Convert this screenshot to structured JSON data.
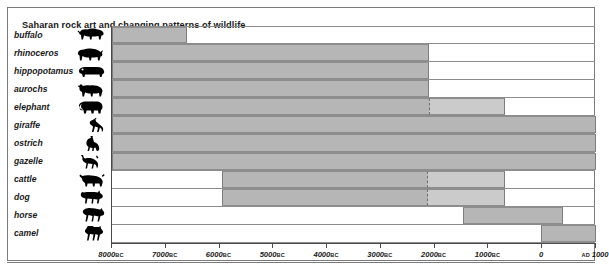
{
  "chart": {
    "title": "Saharan rock art and changing patterns of wildlife"
  },
  "chart_data": {
    "type": "bar",
    "title": "Saharan rock art and changing patterns of wildlife",
    "xlabel": "",
    "ylabel": "",
    "orientation": "horizontal",
    "note": "Horizontal range bars: each animal's period of depiction in Saharan rock art. Negative years = BC, positive = AD. Lighter segment after dashed line indicates uncertain / declining presence.",
    "xlim": [
      -8000,
      1000
    ],
    "grid": false,
    "legend": null,
    "xticks": [
      -8000,
      -7000,
      -6000,
      -5000,
      -4000,
      -3000,
      -2000,
      -1000,
      0,
      1000
    ],
    "xticklabels": [
      "8000 BC",
      "7000 BC",
      "6000 BC",
      "5000 BC",
      "4000 BC",
      "3000 BC",
      "2000 BC",
      "1000 BC",
      "0",
      "AD 1000"
    ],
    "categories": [
      "buffalo",
      "rhinoceros",
      "hippopotamus",
      "aurochs",
      "elephant",
      "giraffe",
      "ostrich",
      "gazelle",
      "cattle",
      "dog",
      "horse",
      "camel"
    ],
    "bars": [
      {
        "label": "buffalo",
        "icon": "buffalo-icon",
        "start": -8000,
        "end": -6600,
        "fade_from": null
      },
      {
        "label": "rhinoceros",
        "icon": "rhinoceros-icon",
        "start": -8000,
        "end": -2100,
        "fade_from": null
      },
      {
        "label": "hippopotamus",
        "icon": "hippopotamus-icon",
        "start": -8000,
        "end": -2100,
        "fade_from": null
      },
      {
        "label": "aurochs",
        "icon": "aurochs-icon",
        "start": -8000,
        "end": -2100,
        "fade_from": null
      },
      {
        "label": "elephant",
        "icon": "elephant-icon",
        "start": -8000,
        "end": -700,
        "fade_from": -2100
      },
      {
        "label": "giraffe",
        "icon": "giraffe-icon",
        "start": -8000,
        "end": 1000,
        "fade_from": null
      },
      {
        "label": "ostrich",
        "icon": "ostrich-icon",
        "start": -8000,
        "end": 1000,
        "fade_from": null
      },
      {
        "label": "gazelle",
        "icon": "gazelle-icon",
        "start": -8000,
        "end": 1000,
        "fade_from": null
      },
      {
        "label": "cattle",
        "icon": "cattle-icon",
        "start": -5950,
        "end": -700,
        "fade_from": -2150
      },
      {
        "label": "dog",
        "icon": "dog-icon",
        "start": -5950,
        "end": -700,
        "fade_from": -2150
      },
      {
        "label": "horse",
        "icon": "horse-icon",
        "start": -1480,
        "end": 380,
        "fade_from": null
      },
      {
        "label": "camel",
        "icon": "camel-icon",
        "start": -30,
        "end": 1000,
        "fade_from": null
      }
    ],
    "colors": {
      "bar": "#b6b6b6",
      "bar_fade": "#cbcbcb",
      "axis": "#4a4a4a",
      "row_rule": "#8d8d8d",
      "frame": "#7a7a7a",
      "text": "#1a1a1a",
      "background": "#ffffff"
    }
  }
}
